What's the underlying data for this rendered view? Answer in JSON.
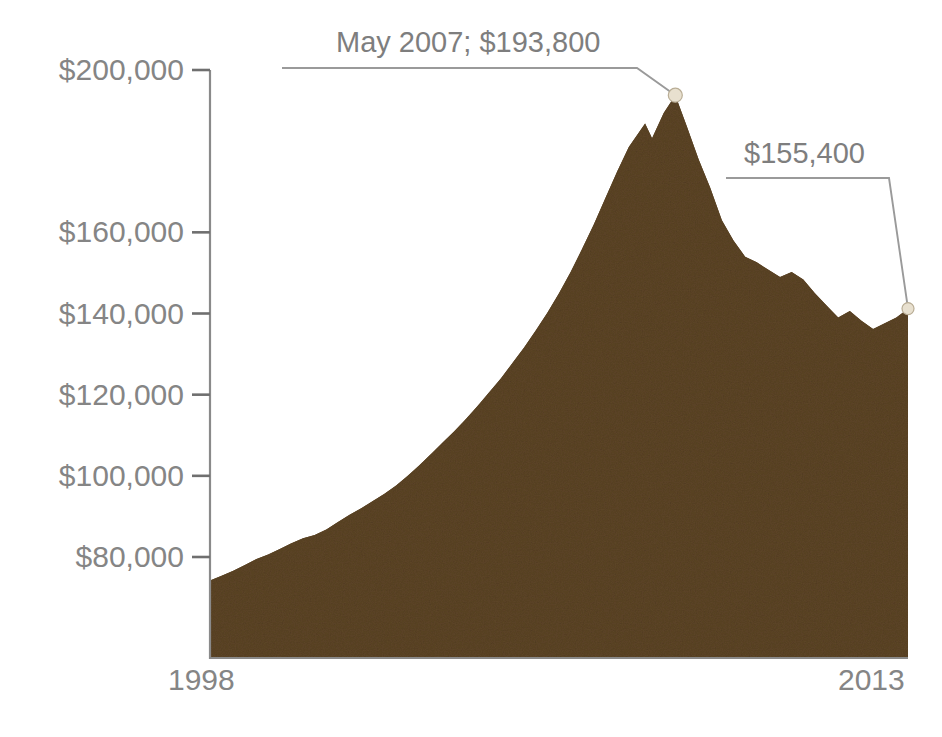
{
  "chart_data": {
    "type": "area",
    "title": "",
    "xlabel": "",
    "ylabel": "",
    "grid": false,
    "legend": null,
    "xlim": [
      1998,
      2013
    ],
    "ylim": [
      60000,
      205000
    ],
    "x_tick_labels": [
      "1998",
      "2013"
    ],
    "y_tick_labels": [
      "$200,000",
      "$160,000",
      "$140,000",
      "$120,000",
      "$100,000",
      "$80,000"
    ],
    "y_tick_values": [
      200000,
      160000,
      140000,
      120000,
      100000,
      80000
    ],
    "note_missing_tick": "180000 label absent in source graphic",
    "series": [
      {
        "name": "Median home value",
        "fill_color": "#5d4526",
        "x": [
          1998.0,
          1998.25,
          1998.5,
          1998.75,
          1999.0,
          1999.25,
          1999.5,
          1999.75,
          2000.0,
          2000.25,
          2000.5,
          2000.75,
          2001.0,
          2001.25,
          2001.5,
          2001.75,
          2002.0,
          2002.25,
          2002.5,
          2002.75,
          2003.0,
          2003.25,
          2003.5,
          2003.75,
          2004.0,
          2004.25,
          2004.5,
          2004.75,
          2005.0,
          2005.25,
          2005.5,
          2005.75,
          2006.0,
          2006.25,
          2006.5,
          2006.75,
          2007.0,
          2007.35,
          2007.5,
          2007.75,
          2008.0,
          2008.25,
          2008.5,
          2008.75,
          2009.0,
          2009.25,
          2009.5,
          2009.75,
          2010.0,
          2010.25,
          2010.5,
          2010.75,
          2011.0,
          2011.25,
          2011.5,
          2011.75,
          2012.0,
          2012.25,
          2012.5,
          2012.75,
          2013.0
        ],
        "values": [
          74200,
          75400,
          76600,
          78000,
          79500,
          80600,
          82000,
          83400,
          84600,
          85400,
          86800,
          88600,
          90400,
          92000,
          93800,
          95600,
          97600,
          100000,
          102600,
          105400,
          108200,
          111000,
          114000,
          117200,
          120600,
          124000,
          127800,
          131600,
          135800,
          140200,
          145000,
          150200,
          156000,
          162000,
          168500,
          175000,
          181000,
          186800,
          183200,
          189400,
          193800,
          186000,
          178000,
          171000,
          163000,
          158000,
          154000,
          152600,
          150800,
          149000,
          150200,
          148400,
          145000,
          142000,
          139000,
          140600,
          138200,
          136200,
          137600,
          139000,
          141200
        ]
      }
    ],
    "annotations": [
      {
        "id": "peak",
        "label": "May 2007; $193,800",
        "value": 193800,
        "date": "May 2007",
        "marker": true
      },
      {
        "id": "latest",
        "label": "$155,400",
        "value": 155400,
        "marker": true
      }
    ]
  },
  "axis": {
    "y_labels": [
      "$200,000",
      "$160,000",
      "$140,000",
      "$120,000",
      "$100,000",
      "$80,000"
    ],
    "x_start": "1998",
    "x_end": "2013"
  },
  "annotations": {
    "peak_label": "May 2007; $193,800",
    "latest_label": "$155,400"
  },
  "colors": {
    "fill": "#5d4526",
    "text": "#858585",
    "axis": "#8a8a8a",
    "leader": "#9a9a9a",
    "marker": "#e8e0cf"
  }
}
